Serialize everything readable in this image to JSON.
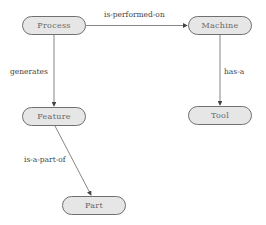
{
  "diagram": {
    "type": "concept-map",
    "nodes": [
      {
        "id": "process",
        "label": "Process",
        "x": 22,
        "y": 16
      },
      {
        "id": "machine",
        "label": "Machine",
        "x": 188,
        "y": 16
      },
      {
        "id": "feature",
        "label": "Feature",
        "x": 22,
        "y": 107
      },
      {
        "id": "tool",
        "label": "Tool",
        "x": 188,
        "y": 106
      },
      {
        "id": "part",
        "label": "Part",
        "x": 62,
        "y": 196
      }
    ],
    "edges": [
      {
        "from": "process",
        "to": "machine",
        "label": "is-performed-on"
      },
      {
        "from": "process",
        "to": "feature",
        "label": "generates"
      },
      {
        "from": "machine",
        "to": "tool",
        "label": "has-a"
      },
      {
        "from": "feature",
        "to": "part",
        "label": "is-a-part-of"
      }
    ],
    "colors": {
      "node_fill": "#e6e6e6",
      "node_border": "#707070",
      "edge": "#555555"
    }
  }
}
